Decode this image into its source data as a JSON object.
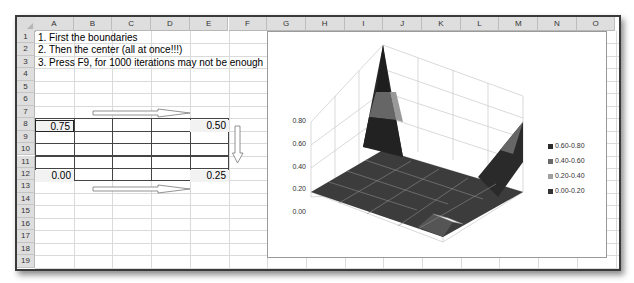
{
  "spreadsheet": {
    "columns": [
      "A",
      "B",
      "C",
      "D",
      "E",
      "F",
      "G",
      "H",
      "I",
      "J",
      "K",
      "L",
      "M",
      "N",
      "O"
    ],
    "rows": [
      "1",
      "2",
      "3",
      "4",
      "5",
      "6",
      "7",
      "8",
      "9",
      "10",
      "11",
      "12",
      "13",
      "14",
      "15",
      "16",
      "17",
      "18",
      "19"
    ],
    "instructions": [
      "1. First the boundaries",
      "2. Then the center (all at once!!!)",
      "3. Press F9, for 1000 iterations may not be enough"
    ],
    "grid_values": {
      "A8": "0.75",
      "E8": "0.50",
      "A12": "0.00",
      "E12": "0.25"
    },
    "arrows": [
      {
        "name": "arrow-right-top",
        "direction": "right"
      },
      {
        "name": "arrow-down-right",
        "direction": "down"
      },
      {
        "name": "arrow-right-bottom",
        "direction": "right"
      }
    ]
  },
  "chart_data": {
    "type": "surface-3d",
    "title": "",
    "z_axis_ticks": [
      "0.00",
      "0.20",
      "0.40",
      "0.60",
      "0.80"
    ],
    "zlim": [
      0,
      0.8
    ],
    "legend": [
      {
        "label": "0.60-0.80",
        "color": "#2b2b2b"
      },
      {
        "label": "0.40-0.60",
        "color": "#6a6a6a"
      },
      {
        "label": "0.20-0.40",
        "color": "#a0a0a0"
      },
      {
        "label": "0.00-0.20",
        "color": "#333333"
      }
    ],
    "legend_position": "right",
    "grid": [
      [
        0.75,
        0.0,
        0.0,
        0.0,
        0.5
      ],
      [
        0.0,
        0.0,
        0.0,
        0.0,
        0.0
      ],
      [
        0.0,
        0.0,
        0.0,
        0.0,
        0.0
      ],
      [
        0.0,
        0.0,
        0.0,
        0.0,
        0.0
      ],
      [
        0.0,
        0.0,
        0.0,
        0.0,
        0.25
      ]
    ]
  }
}
